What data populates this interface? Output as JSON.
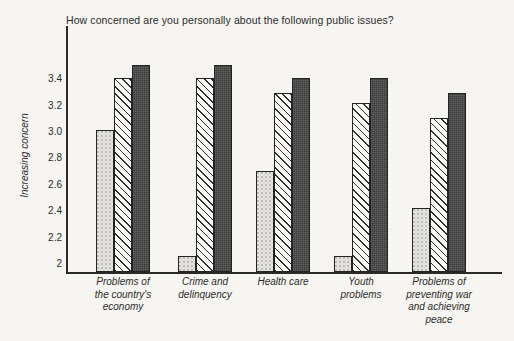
{
  "chart_data": {
    "type": "bar",
    "title": "How concerned are you personally about the following public issues?",
    "xlabel": "",
    "ylabel": "Increasing concern",
    "ylim": [
      1.93,
      3.58
    ],
    "grid": false,
    "legend": "none",
    "yticks": [
      "2",
      "2.2",
      "2.4",
      "2.6",
      "2.8",
      "3.0",
      "3.2",
      "3.4"
    ],
    "ytick_values": [
      2,
      2.2,
      2.4,
      2.6,
      2.8,
      3.0,
      3.2,
      3.4
    ],
    "categories": [
      "Problems of\nthe country's\neconomy",
      "Crime and\ndelinquency",
      "Health care",
      "Youth\nproblems",
      "Problems of\npreventing war\nand achieving\npeace"
    ],
    "category_lines": [
      [
        "Problems of",
        "the country's",
        "economy"
      ],
      [
        "Crime and",
        "delinquency"
      ],
      [
        "Health care"
      ],
      [
        "Youth",
        "problems"
      ],
      [
        "Problems of",
        "preventing war",
        "and achieving",
        "peace"
      ]
    ],
    "series": [
      {
        "name": "series-1",
        "pattern": "light-stipple",
        "values": [
          3.01,
          2.05,
          2.7,
          2.05,
          2.42
        ]
      },
      {
        "name": "series-2",
        "pattern": "diagonal-hatch",
        "values": [
          3.4,
          3.4,
          3.29,
          3.21,
          3.1
        ]
      },
      {
        "name": "series-3",
        "pattern": "dark-solid",
        "values": [
          3.5,
          3.5,
          3.4,
          3.4,
          3.29
        ]
      }
    ]
  },
  "colors": {
    "background": "#f6f5f1",
    "axis": "#2a2a2a",
    "text": "#2b2b2b",
    "series_light": "#e8e7e3",
    "series_hatch": "#fbfaf7",
    "series_dark": "#3b3b3b"
  },
  "geometry": {
    "baseline_y": 272,
    "axis_left_x": 66,
    "px_per_unit": 132.0,
    "value_at_baseline": 1.932,
    "bar_width": 18,
    "group_starts": [
      96,
      178,
      256,
      334,
      412
    ]
  }
}
